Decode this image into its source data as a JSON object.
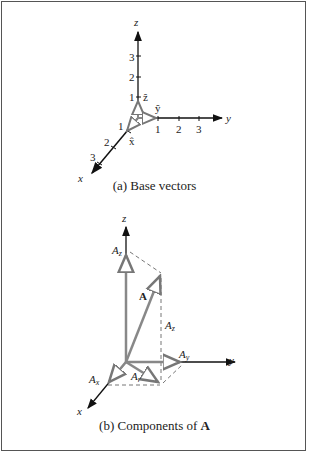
{
  "figure_a": {
    "caption": "(a)  Base vectors",
    "axes": {
      "x": "x",
      "y": "y",
      "z": "z"
    },
    "ticks": {
      "x": [
        "1",
        "2",
        "3"
      ],
      "y": [
        "1",
        "2",
        "3"
      ],
      "z": [
        "1",
        "2",
        "3"
      ]
    },
    "unit_vectors": {
      "x": "x̂",
      "y": "ŷ",
      "z": "ẑ"
    }
  },
  "figure_b": {
    "caption_prefix": "(b)  Components of ",
    "caption_bold": "A",
    "axes": {
      "x": "x",
      "y": "y",
      "z": "z"
    },
    "labels": {
      "A": "A",
      "Ax": "A",
      "Ax_sub": "x",
      "Ay": "A",
      "Ay_sub": "y",
      "Az_top": "A",
      "Az_top_sub": "z",
      "Az_side": "A",
      "Az_side_sub": "z",
      "Ar": "A",
      "Ar_sub": "r"
    }
  }
}
